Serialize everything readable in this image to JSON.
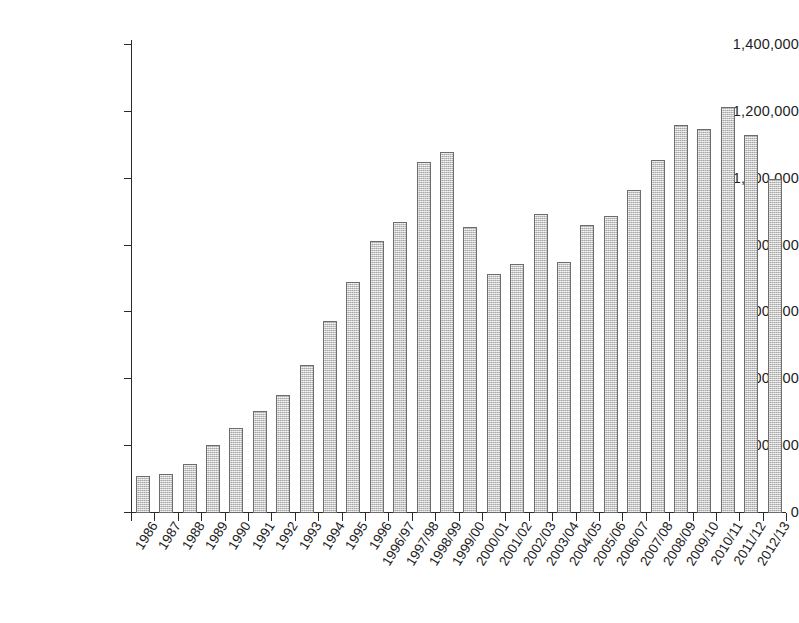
{
  "chart_data": {
    "type": "bar",
    "title": "",
    "subtitle": "",
    "xlabel": "",
    "ylabel": "",
    "ylim": [
      0,
      1400000
    ],
    "ytick_values": [
      0,
      200000,
      400000,
      600000,
      800000,
      1000000,
      1200000,
      1400000
    ],
    "ytick_labels": [
      "0",
      "200,000",
      "400,000",
      "600,000",
      "800,000",
      "1,000,000",
      "1,200,000",
      "1,400,000"
    ],
    "grid": false,
    "legend": null,
    "bar_style": {
      "fill": "#d2d2d2",
      "edge": "#6d6d6d",
      "texture": "speckled-gray"
    },
    "categories": [
      "1986",
      "1987",
      "1988",
      "1989",
      "1990",
      "1991",
      "1992",
      "1993",
      "1994",
      "1995",
      "1996",
      "1996/97",
      "1997/98",
      "1998/99",
      "1999/00",
      "2000/01",
      "2001/02",
      "2002/03",
      "2003/04",
      "2004/05",
      "2005/06",
      "2006/07",
      "2007/08",
      "2008/09",
      "2009/10",
      "2010/11",
      "2011/12",
      "2012/13"
    ],
    "values": [
      112000,
      118000,
      148000,
      202000,
      255000,
      305000,
      352000,
      442000,
      575000,
      690000,
      815000,
      870000,
      1050000,
      1080000,
      855000,
      715000,
      745000,
      895000,
      752000,
      862000,
      890000,
      965000,
      1055000,
      1160000,
      1150000,
      1215000,
      1130000,
      1000000
    ]
  },
  "axis": {
    "y_tick_count": 8,
    "x_tick_count": 29
  }
}
